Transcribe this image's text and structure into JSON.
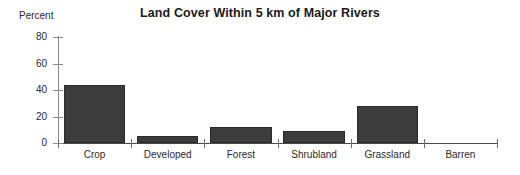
{
  "chart_data": {
    "type": "bar",
    "title": "Land Cover Within 5 km of Major Rivers",
    "xlabel": "",
    "ylabel": "Percent",
    "ylim": [
      0,
      80
    ],
    "yticks": [
      0,
      20,
      40,
      60,
      80
    ],
    "grid": false,
    "legend": false,
    "bar_color": "#3c3c3c",
    "categories": [
      "Crop",
      "Developed",
      "Forest",
      "Shrubland",
      "Grassland",
      "Barren"
    ],
    "values": [
      43.5,
      5,
      12,
      9,
      28,
      0
    ]
  }
}
